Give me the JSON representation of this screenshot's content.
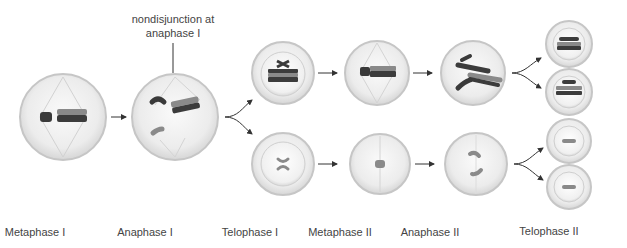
{
  "annotation": {
    "line1": "nondisjunction at",
    "line2": "anaphase I"
  },
  "stages": [
    {
      "label": "Metaphase I"
    },
    {
      "label": "Anaphase I"
    },
    {
      "label": "Telophase I"
    },
    {
      "label": "Metaphase II"
    },
    {
      "label": "Anaphase II"
    },
    {
      "label": "Telophase II"
    }
  ],
  "colors": {
    "cell_fill": "#ececec",
    "cell_rim": "#c8c8c8",
    "chromosome_dark": "#3a3a3a",
    "chromosome_mid": "#8a8a8a",
    "chromosome_light": "#a6a6a6",
    "arrow": "#333333"
  }
}
